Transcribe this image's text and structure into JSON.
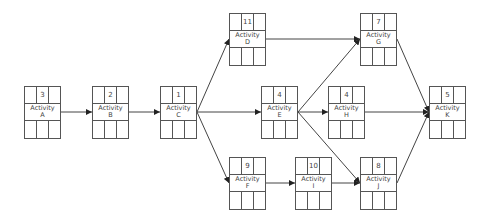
{
  "diagram": {
    "type": "activity-on-node network",
    "nodes": [
      {
        "id": "A",
        "word": "Activity",
        "letter": "A",
        "duration": "3",
        "x": 24,
        "y": 86
      },
      {
        "id": "B",
        "word": "Activity",
        "letter": "B",
        "duration": "2",
        "x": 92,
        "y": 86
      },
      {
        "id": "C",
        "word": "Activity",
        "letter": "C",
        "duration": "1",
        "x": 160,
        "y": 86
      },
      {
        "id": "D",
        "word": "Activity",
        "letter": "D",
        "duration": "11",
        "x": 229,
        "y": 13
      },
      {
        "id": "E",
        "word": "Activity",
        "letter": "E",
        "duration": "4",
        "x": 261,
        "y": 86
      },
      {
        "id": "F",
        "word": "Activity",
        "letter": "F",
        "duration": "9",
        "x": 229,
        "y": 157
      },
      {
        "id": "G",
        "word": "Activity",
        "letter": "G",
        "duration": "7",
        "x": 360,
        "y": 13
      },
      {
        "id": "H",
        "word": "Activity",
        "letter": "H",
        "duration": "4",
        "x": 328,
        "y": 86
      },
      {
        "id": "I",
        "word": "Activity",
        "letter": "I",
        "duration": "10",
        "x": 295,
        "y": 157
      },
      {
        "id": "J",
        "word": "Activity",
        "letter": "J",
        "duration": "8",
        "x": 360,
        "y": 157
      },
      {
        "id": "K",
        "word": "Activity",
        "letter": "K",
        "duration": "5",
        "x": 429,
        "y": 86
      }
    ],
    "edges": [
      [
        "A",
        "B"
      ],
      [
        "B",
        "C"
      ],
      [
        "C",
        "D"
      ],
      [
        "C",
        "E"
      ],
      [
        "C",
        "F"
      ],
      [
        "D",
        "G"
      ],
      [
        "E",
        "G"
      ],
      [
        "E",
        "H"
      ],
      [
        "E",
        "J"
      ],
      [
        "F",
        "I"
      ],
      [
        "I",
        "J"
      ],
      [
        "G",
        "K"
      ],
      [
        "H",
        "K"
      ],
      [
        "J",
        "K"
      ]
    ],
    "colors": {
      "line": "#444444",
      "box_border": "#555555",
      "text": "#444444"
    }
  }
}
